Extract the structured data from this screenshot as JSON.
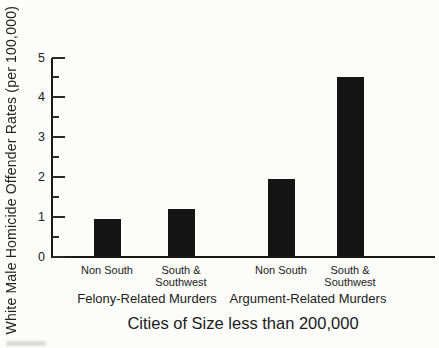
{
  "chart_data": {
    "type": "bar",
    "title": "Cities of Size less than 200,000",
    "ylabel": "White Male Homicide Offender Rates (per 100,000)",
    "xlabel": "",
    "ylim": [
      0,
      5
    ],
    "yticks": [
      0,
      1,
      2,
      3,
      4,
      5
    ],
    "minor_tick_step": 0.5,
    "grid": false,
    "legend": false,
    "bar_color": "#141414",
    "groups": [
      {
        "label": "Felony-Related Murders",
        "categories": [
          "Non South",
          "South &\nSouthwest"
        ],
        "values": [
          0.95,
          1.2
        ]
      },
      {
        "label": "Argument-Related Murders",
        "categories": [
          "Non South",
          "South &\nSouthwest"
        ],
        "values": [
          1.95,
          4.5
        ]
      }
    ]
  }
}
